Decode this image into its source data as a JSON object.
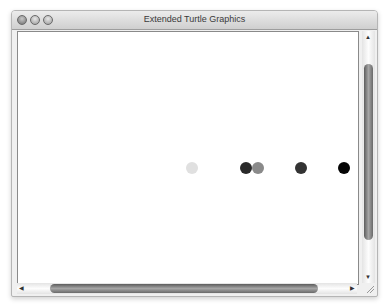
{
  "window": {
    "title": "Extended Turtle Graphics",
    "controls": [
      "close",
      "minimize",
      "zoom"
    ]
  },
  "canvas": {
    "dots": [
      {
        "x": 174,
        "y": 136,
        "color": "#e0e0e0"
      },
      {
        "x": 228,
        "y": 136,
        "color": "#2a2a2a"
      },
      {
        "x": 240,
        "y": 136,
        "color": "#8a8a8a"
      },
      {
        "x": 283,
        "y": 136,
        "color": "#333333"
      },
      {
        "x": 326,
        "y": 136,
        "color": "#050505"
      }
    ]
  },
  "scrollbars": {
    "vertical": {
      "up_arrow": "▲",
      "down_arrow": "▼"
    },
    "horizontal": {
      "left_arrow": "◀",
      "right_arrow": "▶"
    }
  }
}
